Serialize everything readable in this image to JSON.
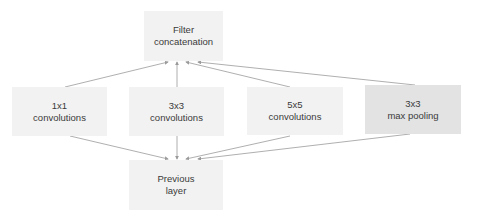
{
  "diagram": {
    "colors": {
      "box": "#f2f2f2",
      "box_pool": "#e3e3e3",
      "arrow": "#9a9a9a",
      "text": "#3a3a3a"
    },
    "nodes": {
      "concat": {
        "line1": "Filter",
        "line2": "concatenation"
      },
      "conv1": {
        "line1": "1x1",
        "line2": "convolutions"
      },
      "conv3": {
        "line1": "3x3",
        "line2": "convolutions"
      },
      "conv5": {
        "line1": "5x5",
        "line2": "convolutions"
      },
      "pool": {
        "line1": "3x3",
        "line2": "max pooling"
      },
      "prev": {
        "line1": "Previous",
        "line2": "layer"
      }
    },
    "edges": [
      {
        "from": "prev",
        "to": "conv1"
      },
      {
        "from": "prev",
        "to": "conv3"
      },
      {
        "from": "prev",
        "to": "conv5"
      },
      {
        "from": "prev",
        "to": "pool"
      },
      {
        "from": "conv1",
        "to": "concat"
      },
      {
        "from": "conv3",
        "to": "concat"
      },
      {
        "from": "conv5",
        "to": "concat"
      },
      {
        "from": "pool",
        "to": "concat"
      }
    ]
  }
}
